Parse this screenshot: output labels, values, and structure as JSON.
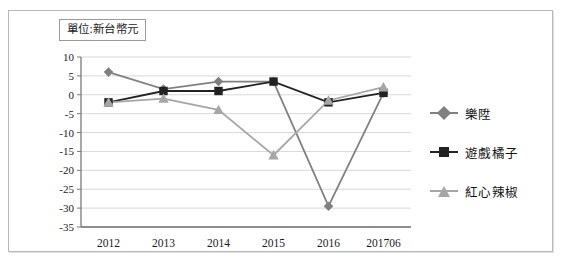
{
  "unit_note": "單位:新台幣元",
  "chart_data": {
    "type": "line",
    "title": "",
    "subtitle": "",
    "xlabel": "",
    "ylabel": "",
    "categories": [
      "2012",
      "2013",
      "2014",
      "2015",
      "2016",
      "201706"
    ],
    "ylim": [
      -35,
      10
    ],
    "ytick_step": 5,
    "yticks": [
      "10",
      "5",
      "0",
      "-5",
      "-10",
      "-15",
      "-20",
      "-25",
      "-30",
      "-35"
    ],
    "grid": true,
    "legend_position": "right",
    "series": [
      {
        "name": "樂陞",
        "marker": "diamond",
        "color": "#808080",
        "values": [
          6,
          1.5,
          3.5,
          3.5,
          -29.5,
          0.5
        ]
      },
      {
        "name": "遊戲橘子",
        "marker": "square",
        "color": "#222222",
        "values": [
          -2,
          1,
          1,
          3.5,
          -2,
          0.5
        ]
      },
      {
        "name": "紅心辣椒",
        "marker": "triangle",
        "color": "#a6a6a6",
        "values": [
          -2,
          -1,
          -4,
          -16,
          -1.5,
          2
        ]
      }
    ]
  },
  "legend": {
    "items": [
      {
        "label": "樂陞",
        "marker": "diamond",
        "color": "#808080"
      },
      {
        "label": "遊戲橘子",
        "marker": "square",
        "color": "#222222"
      },
      {
        "label": "紅心辣椒",
        "marker": "triangle",
        "color": "#a6a6a6"
      }
    ]
  },
  "colors": {
    "frame_border": "#b9b9b9",
    "grid": "#d8d8d8",
    "axis": "#7a7a7a",
    "background": "#ffffff"
  }
}
